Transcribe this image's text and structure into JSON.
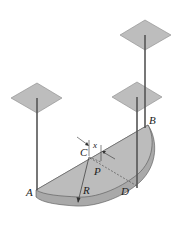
{
  "diagram": {
    "type": "mechanics-figure",
    "labels": {
      "A": "A",
      "B": "B",
      "C": "C",
      "D": "D",
      "P": "P",
      "R": "R",
      "x": "x"
    },
    "colors": {
      "plate_face": "#b8b8b8",
      "plate_edge": "#a4a4a4",
      "ceiling_plate": "#bdbdbd",
      "cable": "#555555",
      "outline": "#333333"
    }
  }
}
